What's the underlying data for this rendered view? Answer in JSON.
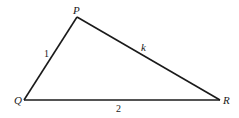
{
  "diagram": {
    "type": "triangle",
    "vertices": [
      {
        "label": "P",
        "x": 77,
        "y": 17
      },
      {
        "label": "Q",
        "x": 24,
        "y": 100
      },
      {
        "label": "R",
        "x": 220,
        "y": 100
      }
    ],
    "sides": [
      {
        "from": "Q",
        "to": "P",
        "label": "1"
      },
      {
        "from": "P",
        "to": "R",
        "label": "k"
      },
      {
        "from": "Q",
        "to": "R",
        "label": "2"
      }
    ],
    "line_color": "#1a1a1a"
  }
}
